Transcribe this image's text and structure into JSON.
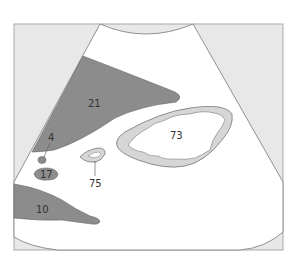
{
  "diagram": {
    "type": "ultrasound-schematic",
    "colors": {
      "background": "#ffffff",
      "frame_fill": "#e8e8e8",
      "frame_stroke": "#aaaaaa",
      "sector_fill": "#ffffff",
      "sector_stroke": "#777777",
      "dark_structure": "#8c8c8c",
      "light_ring": "#d6d6d6",
      "outline": "#666666",
      "text": "#333333"
    },
    "labels": {
      "l21": "21",
      "l4": "4",
      "l17": "17",
      "l10": "10",
      "l73": "73",
      "l75": "75"
    }
  }
}
